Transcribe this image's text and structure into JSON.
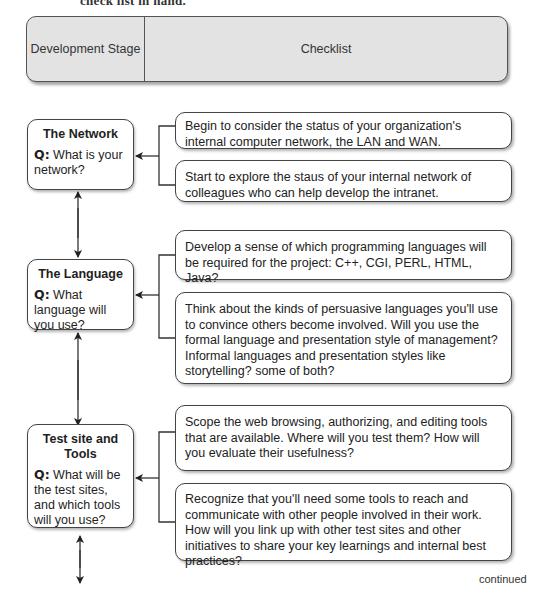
{
  "page": {
    "clipped_top_text": "check list in hand."
  },
  "header": {
    "stage_label": "Development Stage",
    "checklist_label": "Checklist",
    "background_color": "#e3e3e3"
  },
  "stages": [
    {
      "title": "The Network",
      "q_label": "Q:",
      "question": "What is your network?",
      "checklist": [
        "Begin to consider the status of your organization's internal computer network, the LAN and WAN.",
        "Start to explore the staus of your internal network of colleagues who can help develop the intranet."
      ]
    },
    {
      "title": "The Language",
      "q_label": "Q:",
      "question": "What language will you use?",
      "checklist": [
        "Develop a sense of which programming languages will be required for the project: C++, CGI, PERL, HTML, Java?",
        "Think about the kinds of persuasive languages you'll use to convince others become involved. Will you use the formal language and presentation style of management? Informal languages and presentation styles like storytelling? some of both?"
      ]
    },
    {
      "title": "Test site and Tools",
      "q_label": "Q:",
      "question": "What will be the test sites, and which tools will you use?",
      "checklist": [
        "Scope the web browsing, authorizing, and editing tools that are available. Where will you test them? How will you evaluate their usefulness?",
        "Recognize that you'll need some tools to reach and communicate with other people involved in their work. How will you link up with other test sites and other initiatives to share your key learnings and internal best practices?"
      ]
    }
  ],
  "footer": {
    "continued_label": "continued"
  }
}
